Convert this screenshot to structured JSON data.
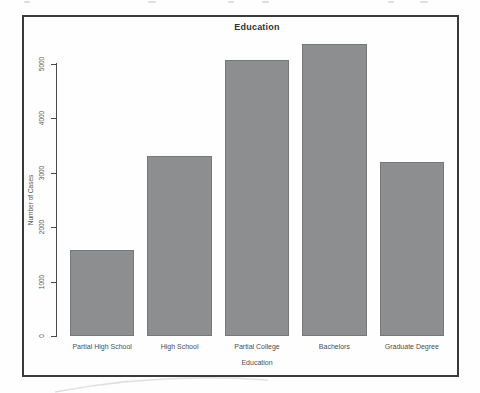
{
  "chart_data": {
    "type": "bar",
    "title": "Education",
    "xlabel": "Education",
    "ylabel": "Number of Cases",
    "categories": [
      "Partial High School",
      "High School",
      "Partial College",
      "Bachelors",
      "Graduate Degree"
    ],
    "values": [
      1581,
      3294,
      5064,
      5356,
      3189
    ],
    "ylim": [
      0,
      5000
    ],
    "yticks": [
      0,
      1000,
      2000,
      3000,
      4000,
      5000
    ],
    "grid": false,
    "legend_position": "none",
    "bar_color": "#8d8e90",
    "bar_border_color": "#77787a",
    "frame_border_color": "#3a3a3c",
    "axis_color": "#4a4a4c",
    "text_color": "#4c4c4e"
  }
}
